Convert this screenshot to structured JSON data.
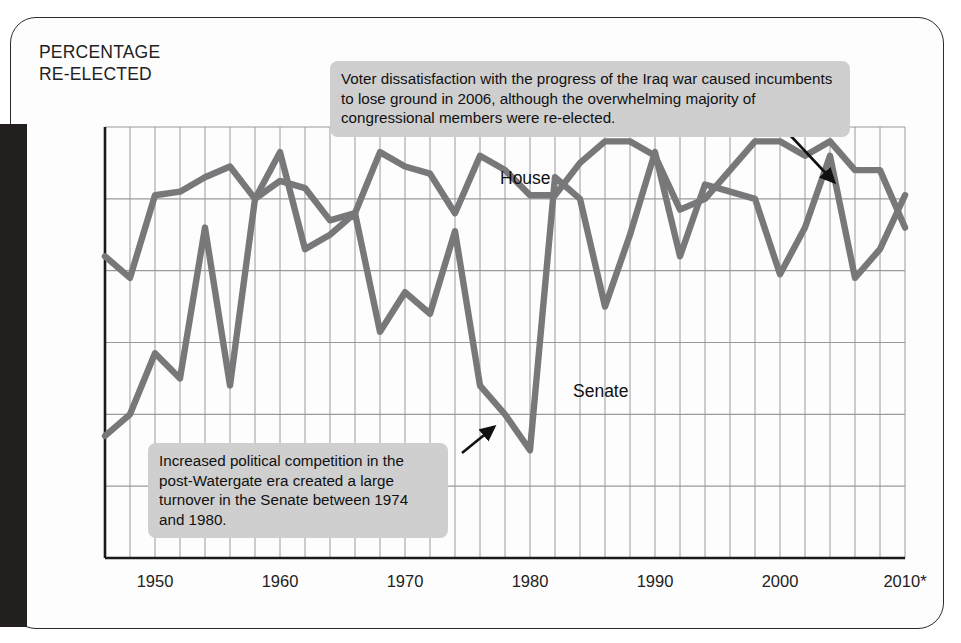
{
  "axis_title": "PERCENTAGE\nRE-ELECTED",
  "annotations": [
    {
      "name": "annotation-iraq-war",
      "text": "Voter dissatisfaction with the progress of the Iraq war caused incumbents to lose ground in 2006, although the overwhelming majority of congressional members were re-elected."
    },
    {
      "name": "annotation-watergate",
      "text": "Increased political competition in the post-Watergate era created a large turnover in the Senate between 1974 and 1980."
    }
  ],
  "labels": {
    "house": "House",
    "senate": "Senate"
  },
  "colors": {
    "line": "#78787a",
    "grid": "#9a9a9a",
    "axis": "#1a1a1a",
    "annotation_bg": "#cfcfcf",
    "text": "#1a1a1a",
    "gutter": "#231f1e"
  },
  "chart_data": {
    "type": "line",
    "title": "PERCENTAGE RE-ELECTED",
    "xlabel": "",
    "ylabel": "PERCENTAGE RE-ELECTED",
    "xlim": [
      1946,
      2010
    ],
    "ylim": [
      40,
      100
    ],
    "ytick_labels": [
      "100%",
      "90%",
      "80%",
      "70%",
      "60%",
      "50%",
      "40%"
    ],
    "yticks": [
      100,
      90,
      80,
      70,
      60,
      50,
      40
    ],
    "xtick_labels": [
      "1950",
      "1960",
      "1970",
      "1980",
      "1990",
      "2000",
      "2010*"
    ],
    "xticks": [
      1950,
      1960,
      1970,
      1980,
      1990,
      2000,
      2010
    ],
    "grid": true,
    "grid_x_step": 2,
    "grid_y_step": 10,
    "legend": "inline-labels",
    "x": [
      1946,
      1948,
      1950,
      1952,
      1954,
      1956,
      1958,
      1960,
      1962,
      1964,
      1966,
      1968,
      1970,
      1972,
      1974,
      1976,
      1978,
      1980,
      1982,
      1984,
      1986,
      1988,
      1990,
      1992,
      1994,
      1996,
      1998,
      2000,
      2002,
      2004,
      2006,
      2008,
      2010
    ],
    "series": [
      {
        "name": "House",
        "values": [
          82,
          79,
          90.5,
          91,
          93,
          94.5,
          90,
          92.5,
          91.5,
          87,
          88,
          96.5,
          94.5,
          93.5,
          88,
          96,
          94,
          90.5,
          90.5,
          95,
          98,
          98,
          96,
          88.5,
          90,
          94,
          98,
          98,
          96,
          98,
          94,
          94,
          86
        ]
      },
      {
        "name": "Senate",
        "values": [
          57,
          60,
          68.5,
          65,
          86,
          64,
          90,
          96.5,
          83,
          85,
          88,
          71.5,
          77,
          74,
          85.5,
          64,
          60,
          55,
          93,
          90,
          75,
          85,
          96.5,
          82,
          92,
          91,
          90,
          79.5,
          86,
          96,
          79,
          83,
          90.5
        ]
      }
    ],
    "footnote_marker": "*"
  }
}
